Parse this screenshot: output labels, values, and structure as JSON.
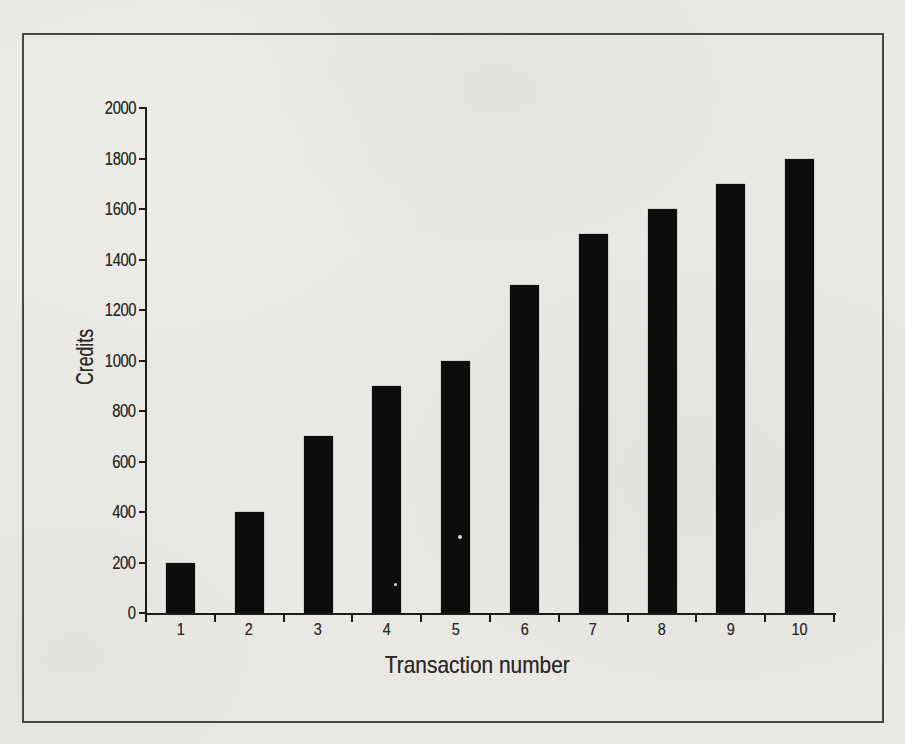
{
  "chart_data": {
    "type": "bar",
    "title": "",
    "xlabel": "Transaction number",
    "ylabel": "Credits",
    "categories": [
      "1",
      "2",
      "3",
      "4",
      "5",
      "6",
      "7",
      "8",
      "9",
      "10"
    ],
    "values": [
      200,
      400,
      700,
      900,
      1000,
      1300,
      1500,
      1600,
      1700,
      1800
    ],
    "ylim": [
      0,
      2000
    ],
    "ytick_interval": 200,
    "ytick_labels": [
      "0",
      "200",
      "400",
      "600",
      "800",
      "1000",
      "1200",
      "1400",
      "1600",
      "1800",
      "2000"
    ],
    "grid": false,
    "legend": false,
    "bar_color": "#0d0d0d"
  },
  "colors": {
    "page_background": "#e9e8e4",
    "frame_border": "#494741",
    "axis": "#1d1c1a",
    "text": "#2b2a27",
    "bar": "#0d0d0d"
  }
}
